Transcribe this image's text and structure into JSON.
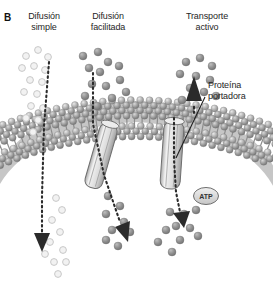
{
  "figure": {
    "panel_letter": "B",
    "background_color": "#ffffff",
    "labels": {
      "simple_diffusion": "Difusión\nsimple",
      "facilitated_diffusion": "Difusión\nfacilitada",
      "active_transport": "Transporte\nactivo",
      "carrier_protein": "Proteína\nportadora",
      "atp": "ATP"
    },
    "colors": {
      "text": "#262626",
      "membrane_head": "#9a9a9a",
      "membrane_head_light": "#cfcfcf",
      "membrane_tail": "#b5b5b5",
      "protein_fill": "#e2e2e2",
      "protein_stroke": "#6e6e6e",
      "solute_dark": "#8c8c8c",
      "solute_light": "#e8e8e8",
      "solute_light_stroke": "#c8c8c8",
      "arrow": "#2b2b2b"
    },
    "structures": {
      "membrane": "curved lipid bilayer arch",
      "channel_protein": "tilted cylindrical channel in bilayer (facilitated diffusion)",
      "carrier_protein": "upright cylindrical carrier protein in bilayer (active transport)"
    },
    "pathways": [
      {
        "name": "simple-diffusion",
        "direction": "downward through bilayer",
        "solute_style": "light open circles"
      },
      {
        "name": "facilitated-diffusion",
        "direction": "downward through channel protein",
        "solute_style": "solid gray circles"
      },
      {
        "name": "active-transport",
        "direction": "downward through carrier protein, plus upward arrow outside",
        "solute_style": "solid gray circles",
        "energy_source": "ATP"
      }
    ]
  }
}
